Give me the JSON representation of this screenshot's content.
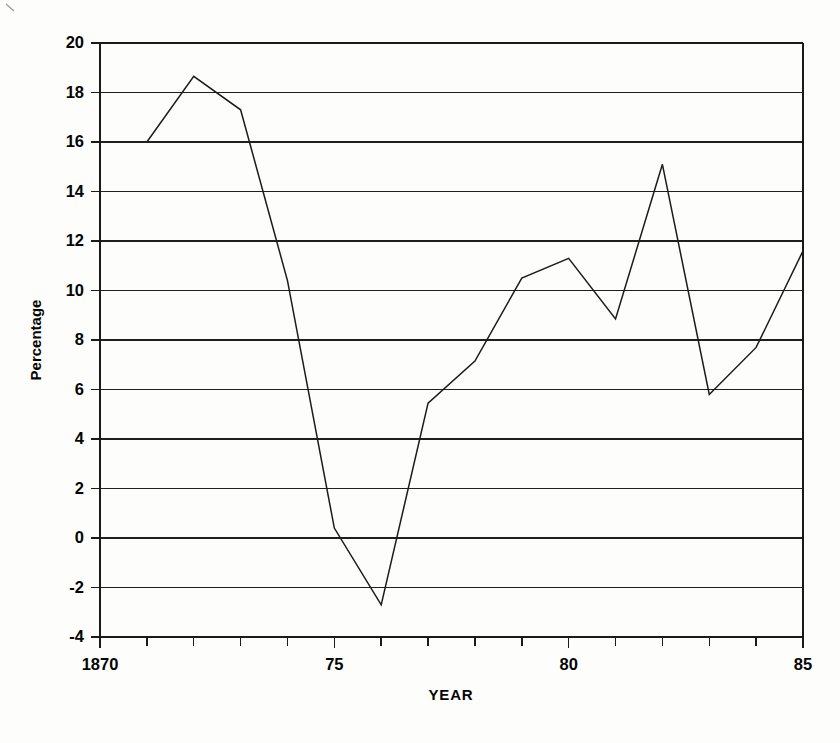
{
  "chart_data": {
    "type": "line",
    "title": "",
    "xlabel": "YEAR",
    "ylabel": "Percentage",
    "xlim": [
      1870,
      1885
    ],
    "ylim": [
      -4,
      20
    ],
    "grid": true,
    "legend": null,
    "x_tick_labels": [
      {
        "value": 1870,
        "label": "1870"
      },
      {
        "value": 1875,
        "label": "75"
      },
      {
        "value": 1880,
        "label": "80"
      },
      {
        "value": 1885,
        "label": "85"
      }
    ],
    "x_minor_ticks": [
      1871,
      1872,
      1873,
      1874,
      1876,
      1877,
      1878,
      1879,
      1881,
      1882,
      1883,
      1884
    ],
    "y_tick_labels": [
      {
        "value": 20,
        "label": "20"
      },
      {
        "value": 18,
        "label": "18"
      },
      {
        "value": 16,
        "label": "16"
      },
      {
        "value": 14,
        "label": "14"
      },
      {
        "value": 12,
        "label": "12"
      },
      {
        "value": 10,
        "label": "10"
      },
      {
        "value": 8,
        "label": "8"
      },
      {
        "value": 6,
        "label": "6"
      },
      {
        "value": 4,
        "label": "4"
      },
      {
        "value": 2,
        "label": "2"
      },
      {
        "value": 0,
        "label": "0"
      },
      {
        "value": -2,
        "label": "-2"
      },
      {
        "value": -4,
        "label": "-4"
      }
    ],
    "x": [
      1871,
      1872,
      1873,
      1874,
      1875,
      1876,
      1877,
      1878,
      1879,
      1880,
      1881,
      1882,
      1883,
      1884,
      1885
    ],
    "series": [
      {
        "name": "Percentage",
        "color": "#1b1b1b",
        "values": [
          16.0,
          18.65,
          17.3,
          10.4,
          0.4,
          -2.7,
          5.45,
          7.15,
          10.5,
          11.3,
          8.85,
          15.1,
          5.8,
          7.7,
          11.6
        ]
      }
    ]
  },
  "axis": {
    "x_title": "YEAR",
    "y_title": "Percentage"
  }
}
